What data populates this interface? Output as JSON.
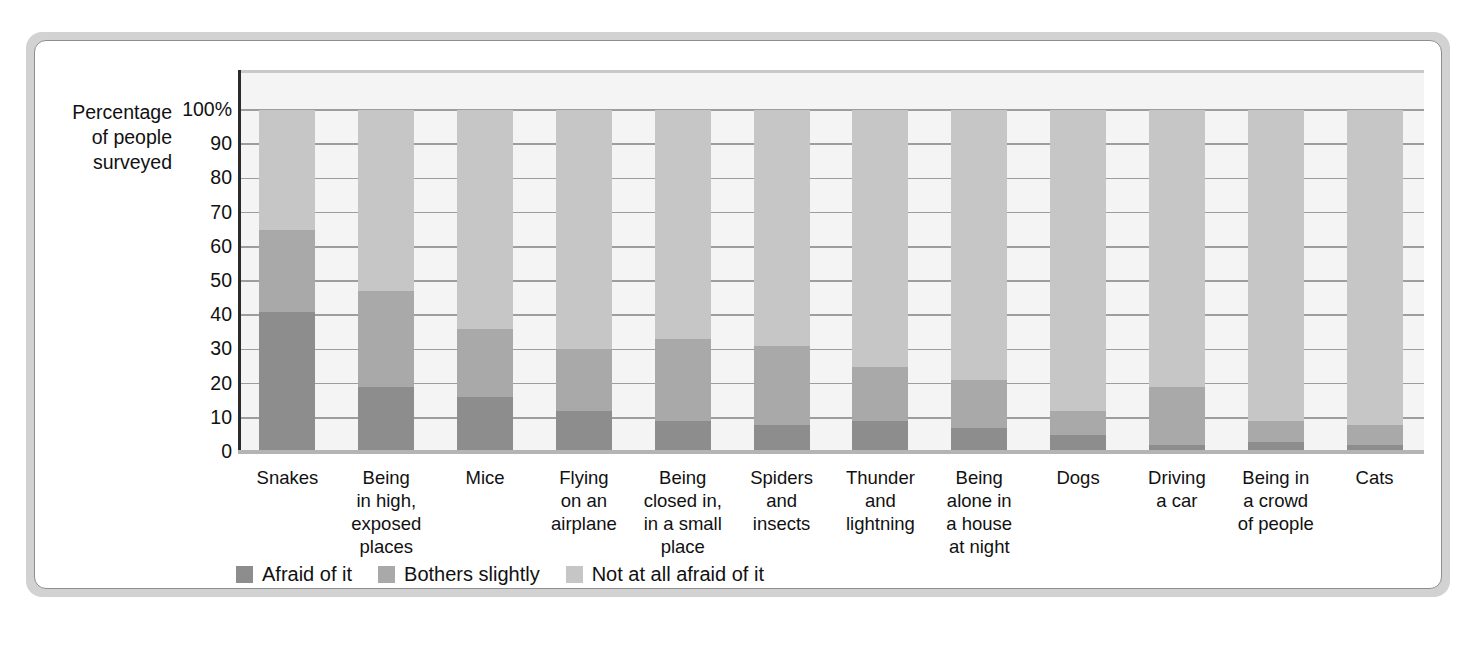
{
  "chart_data": {
    "type": "bar",
    "subtype": "stacked-bar-100",
    "title": "",
    "xlabel": "",
    "ylabel": "Percentage\nof people\nsurveyed",
    "ylim": [
      0,
      100
    ],
    "ytick_labels": [
      "100%",
      "90",
      "80",
      "70",
      "60",
      "50",
      "40",
      "30",
      "20",
      "10",
      "0"
    ],
    "ytick_values": [
      100,
      90,
      80,
      70,
      60,
      50,
      40,
      30,
      20,
      10,
      0
    ],
    "grid": true,
    "legend_position": "bottom-left",
    "categories": [
      "Snakes",
      "Being\nin high,\nexposed\nplaces",
      "Mice",
      "Flying\non an\nairplane",
      "Being\nclosed in,\nin a small\nplace",
      "Spiders\nand\ninsects",
      "Thunder\nand\nlightning",
      "Being\nalone in\na house\nat night",
      "Dogs",
      "Driving\na car",
      "Being in\na crowd\nof people",
      "Cats"
    ],
    "series": [
      {
        "name": "Afraid of it",
        "color": "#8d8d8d",
        "values": [
          41,
          19,
          16,
          12,
          9,
          8,
          9,
          7,
          5,
          2,
          3,
          2
        ]
      },
      {
        "name": "Bothers slightly",
        "color": "#a9a9a9",
        "values": [
          24,
          28,
          20,
          18,
          24,
          23,
          16,
          14,
          7,
          17,
          6,
          6
        ]
      },
      {
        "name": "Not at all afraid of it",
        "color": "#c6c6c6",
        "values": [
          35,
          53,
          64,
          70,
          67,
          69,
          75,
          79,
          88,
          81,
          91,
          92
        ]
      }
    ],
    "cumulative_tops": {
      "afraid": [
        41,
        19,
        16,
        12,
        9,
        8,
        9,
        7,
        5,
        2,
        3,
        2
      ],
      "bothers": [
        65,
        47,
        36,
        30,
        33,
        31,
        25,
        21,
        12,
        19,
        9,
        8
      ],
      "total": [
        100,
        100,
        100,
        100,
        100,
        100,
        100,
        100,
        100,
        100,
        100,
        100
      ]
    }
  },
  "legend": {
    "items": [
      {
        "label": "Afraid of it",
        "color": "#8d8d8d"
      },
      {
        "label": "Bothers slightly",
        "color": "#a9a9a9"
      },
      {
        "label": "Not at all afraid of it",
        "color": "#c6c6c6"
      }
    ]
  }
}
